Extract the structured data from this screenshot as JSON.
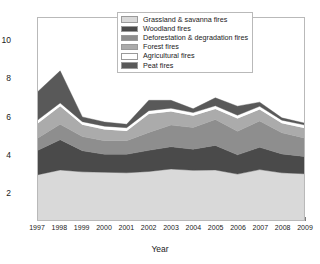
{
  "chart_data": {
    "type": "area",
    "stacked": true,
    "title": "",
    "xlabel": "Year",
    "ylabel": "Fire emissions (Gt CO2 year-1)",
    "ylabel_rich": "Fire emissions (Gt CO<sub>2</sub> year<sup>-1</sup>)",
    "x": [
      1997,
      1998,
      1999,
      2000,
      2001,
      2002,
      2003,
      2004,
      2005,
      2006,
      2007,
      2008,
      2009
    ],
    "categories": [
      "1997",
      "1998",
      "1999",
      "2000",
      "2001",
      "2002",
      "2003",
      "2004",
      "2005",
      "2006",
      "2007",
      "2008",
      "2009"
    ],
    "xlim": [
      1997,
      2009
    ],
    "ylim": [
      0.55,
      11.25
    ],
    "yticks": [
      2,
      4,
      6,
      8,
      10
    ],
    "ytick_labels": [
      "2",
      "4",
      "6",
      "8",
      "10"
    ],
    "grid": false,
    "legend_position": "top-center",
    "series": [
      {
        "name": "Grassland & savanna fires",
        "color": "#d9d9d9",
        "values": [
          2.95,
          3.2,
          3.1,
          3.08,
          3.05,
          3.12,
          3.25,
          3.18,
          3.2,
          2.98,
          3.22,
          3.05,
          3.0
        ]
      },
      {
        "name": "Woodland fires",
        "color": "#4a4a4a",
        "values": [
          1.3,
          1.6,
          1.12,
          0.95,
          0.98,
          1.12,
          1.18,
          1.12,
          1.3,
          1.02,
          1.18,
          1.0,
          0.92
        ]
      },
      {
        "name": "Deforestation & degradation fires",
        "color": "#8e8e8e",
        "values": [
          0.65,
          0.82,
          0.75,
          0.72,
          0.72,
          0.95,
          1.15,
          1.15,
          1.38,
          1.25,
          1.4,
          1.12,
          0.98
        ]
      },
      {
        "name": "Forest fires",
        "color": "#ababab",
        "values": [
          0.78,
          0.95,
          0.62,
          0.6,
          0.52,
          0.98,
          0.72,
          0.62,
          0.55,
          0.68,
          0.6,
          0.5,
          0.52
        ]
      },
      {
        "name": "Agricultural fires",
        "color": "#ffffff",
        "values": [
          0.18,
          0.18,
          0.17,
          0.17,
          0.17,
          0.17,
          0.17,
          0.17,
          0.17,
          0.17,
          0.17,
          0.17,
          0.17
        ]
      },
      {
        "name": "Peat fires",
        "color": "#595959",
        "values": [
          1.5,
          1.7,
          0.25,
          0.22,
          0.18,
          0.55,
          0.42,
          0.2,
          0.42,
          0.48,
          0.22,
          0.12,
          0.1
        ]
      }
    ],
    "stack_tops": {
      "grassland": [
        2.95,
        3.2,
        3.1,
        3.08,
        3.05,
        3.12,
        3.25,
        3.18,
        3.2,
        2.98,
        3.22,
        3.05,
        3.0
      ],
      "woodland": [
        4.25,
        4.8,
        4.22,
        4.03,
        4.03,
        4.24,
        4.43,
        4.3,
        4.5,
        4.0,
        4.4,
        4.05,
        3.92
      ],
      "deforestation": [
        4.9,
        5.62,
        4.97,
        4.75,
        4.75,
        5.19,
        5.58,
        5.45,
        5.88,
        5.25,
        5.8,
        5.17,
        4.9
      ],
      "forest": [
        5.68,
        6.57,
        5.59,
        5.35,
        5.27,
        6.17,
        6.3,
        6.07,
        6.43,
        5.93,
        6.4,
        5.67,
        5.42
      ],
      "agricultural": [
        5.86,
        6.75,
        5.76,
        5.52,
        5.44,
        6.34,
        6.47,
        6.24,
        6.6,
        6.1,
        6.57,
        5.84,
        5.59
      ],
      "peat": [
        7.36,
        8.45,
        6.01,
        5.74,
        5.62,
        6.89,
        6.89,
        6.44,
        7.02,
        6.58,
        6.79,
        5.96,
        5.69
      ]
    }
  },
  "legend": {
    "items": [
      {
        "label": "Grassland & savanna fires",
        "color": "#d9d9d9"
      },
      {
        "label": "Woodland fires",
        "color": "#4a4a4a"
      },
      {
        "label": "Deforestation & degradation fires",
        "color": "#8e8e8e"
      },
      {
        "label": "Forest fires",
        "color": "#ababab"
      },
      {
        "label": "Agricultural fires",
        "color": "#ffffff"
      },
      {
        "label": "Peat fires",
        "color": "#595959"
      }
    ]
  },
  "axes": {
    "x_title": "Year",
    "y_title_plain": "Fire emissions (Gt CO2 year-1)"
  }
}
